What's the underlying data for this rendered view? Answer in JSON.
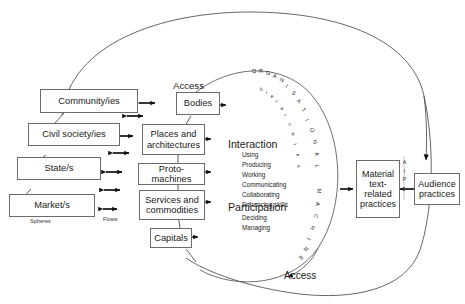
{
  "diagram": {
    "spheres_caption": "Spheres",
    "flows_caption": "Flows",
    "access_top": "Access",
    "access_bottom": "Access",
    "outer_ring_text": "ORGANISATIONAL MACHINE",
    "inner_ring_text": "hierarchies",
    "aip_letters": [
      "A",
      "I",
      "P"
    ],
    "spheres": [
      {
        "label": "Community/ies"
      },
      {
        "label": "Civil society/ies"
      },
      {
        "label": "State/s"
      },
      {
        "label": "Market/s"
      }
    ],
    "flows": [
      {
        "label": "Bodies"
      },
      {
        "label": "Places and architectures"
      },
      {
        "label": "Proto-machines"
      },
      {
        "label": "Services and commodities"
      },
      {
        "label": "Capitals"
      }
    ],
    "practices": [
      {
        "label": "Material text-related practices"
      },
      {
        "label": "Audience practices"
      }
    ],
    "activities": [
      {
        "heading": "Interaction",
        "items": [
          "Using",
          "Producing",
          "Working",
          "Communicating",
          "Collaborating",
          "Enhancing skills"
        ]
      },
      {
        "heading": "Participation",
        "items": [
          "Deciding",
          "Managing"
        ]
      }
    ],
    "colors": {
      "box_border": "#6b6b6b",
      "line": "#4a4a4a",
      "arrow": "#111111",
      "text": "#1a1a1a",
      "background": "#ffffff"
    }
  }
}
